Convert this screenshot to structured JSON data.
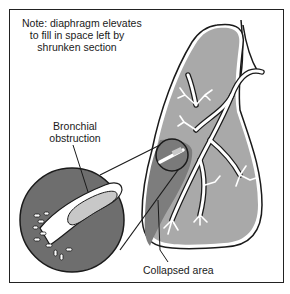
{
  "diagram": {
    "type": "medical-illustration",
    "labels": {
      "note": {
        "line1": "Note: diaphragm elevates",
        "line2": "to fill in space left by",
        "line3": "shrunken section"
      },
      "bronchial_obstruction": {
        "line1": "Bronchial",
        "line2": "obstruction"
      },
      "collapsed_area": "Collapsed area"
    },
    "colors": {
      "lung_fill": "#a9a9a9",
      "collapsed_fill": "#7a7a7a",
      "magnified_fill": "#6e6e6e",
      "obstruction_fill": "#c8c8c8",
      "airway": "#ffffff",
      "outline": "#1a1a1a"
    }
  }
}
